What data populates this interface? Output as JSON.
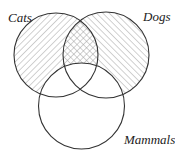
{
  "diagram": {
    "type": "venn",
    "sets": [
      {
        "id": "cats",
        "label": "Cats",
        "cx": 56,
        "cy": 55,
        "r": 42,
        "hatch": "back-diagonal"
      },
      {
        "id": "dogs",
        "label": "Dogs",
        "cx": 106,
        "cy": 55,
        "r": 43,
        "hatch": "forward-diagonal"
      },
      {
        "id": "mammals",
        "label": "Mammals",
        "cx": 81.5,
        "cy": 106,
        "r": 43,
        "hatch": "none"
      }
    ],
    "shading": {
      "cats_only_outside_mammals": "back-diagonal hatch",
      "dogs_only_outside_mammals": "forward-diagonal hatch",
      "cats_and_dogs_outside_mammals": "cross-hatch",
      "inside_mammals": "unshaded"
    },
    "colors": {
      "stroke": "#333333",
      "hatch": "#9a9a9a",
      "background": "#ffffff"
    }
  },
  "labels": {
    "cats": "Cats",
    "dogs": "Dogs",
    "mammals": "Mammals"
  }
}
